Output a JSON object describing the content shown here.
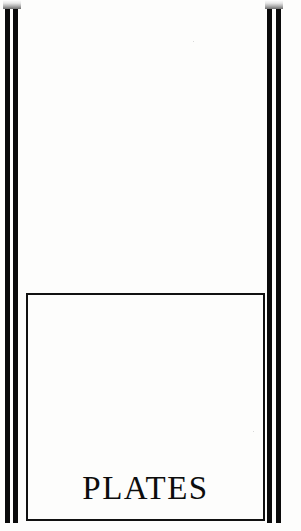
{
  "page": {
    "kind": "book-divider-page",
    "width": 301,
    "height": 531,
    "background_color": "#fdfdfc",
    "ink_color": "#0d0d0d"
  },
  "title": {
    "text": "PLATES"
  },
  "frame": {
    "left_rules_label": "left double rule",
    "right_rules_label": "right double rule",
    "inner_box_label": "inner frame"
  }
}
